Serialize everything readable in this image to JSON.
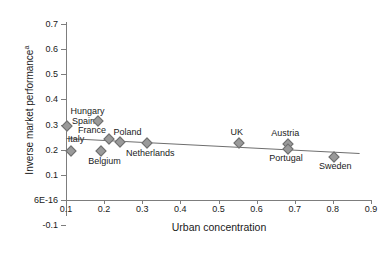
{
  "chart_data": {
    "type": "scatter",
    "title": "",
    "xlabel": "Urban concentration",
    "ylabel": "Inverse market performance",
    "ylabel_superscript": "a",
    "xlim": [
      0.1,
      0.9
    ],
    "ylim": [
      -0.1,
      0.7
    ],
    "grid": false,
    "legend": "none",
    "xticks": [
      "0.1",
      "0.2",
      "0.3",
      "0.4",
      "0.5",
      "0.6",
      "0.7",
      "0.8",
      "0.9"
    ],
    "xtick_values": [
      0.1,
      0.2,
      0.3,
      0.4,
      0.5,
      0.6,
      0.7,
      0.8,
      0.9
    ],
    "yticks": [
      "0.7",
      "0.6",
      "0.5",
      "0.4",
      "0.3",
      "0.2",
      "0.1",
      "6E-16",
      "-0.1"
    ],
    "ytick_values": [
      0.7,
      0.6,
      0.5,
      0.4,
      0.3,
      0.2,
      0.1,
      0.0,
      -0.1
    ],
    "points": [
      {
        "label": "Spain",
        "x": 0.1,
        "y": 0.3,
        "label_dx": 6,
        "label_dy": -9
      },
      {
        "label": "Italy",
        "x": 0.11,
        "y": 0.2,
        "label_dx": -2,
        "label_dy": -16
      },
      {
        "label": "Hungary",
        "x": 0.18,
        "y": 0.32,
        "label_dx": -26,
        "label_dy": -14
      },
      {
        "label": "Belgium",
        "x": 0.19,
        "y": 0.2,
        "label_dx": -12,
        "label_dy": 6
      },
      {
        "label": "France",
        "x": 0.21,
        "y": 0.245,
        "label_dx": -30,
        "label_dy": -13
      },
      {
        "label": "Poland",
        "x": 0.24,
        "y": 0.235,
        "label_dx": -6,
        "label_dy": -14
      },
      {
        "label": "Netherlands",
        "x": 0.31,
        "y": 0.23,
        "label_dx": -20,
        "label_dy": 6
      },
      {
        "label": "UK",
        "x": 0.55,
        "y": 0.23,
        "label_dx": -7,
        "label_dy": -15
      },
      {
        "label": "Austria",
        "x": 0.68,
        "y": 0.228,
        "label_dx": -16,
        "label_dy": -15
      },
      {
        "label": "Portugal",
        "x": 0.68,
        "y": 0.208,
        "label_dx": -18,
        "label_dy": 5
      },
      {
        "label": "Sweden",
        "x": 0.8,
        "y": 0.175,
        "label_dx": -14,
        "label_dy": 5
      }
    ],
    "trend_line": {
      "x0": 0.1,
      "y0": 0.248,
      "x1": 0.87,
      "y1": 0.188
    }
  },
  "colors": {
    "marker_fill": "#9a9a9a",
    "marker_stroke": "#6e6e6e",
    "axis": "#7d7d7d",
    "trend": "#6e6e6e",
    "text": "#1a1a1a",
    "background": "#ffffff"
  }
}
